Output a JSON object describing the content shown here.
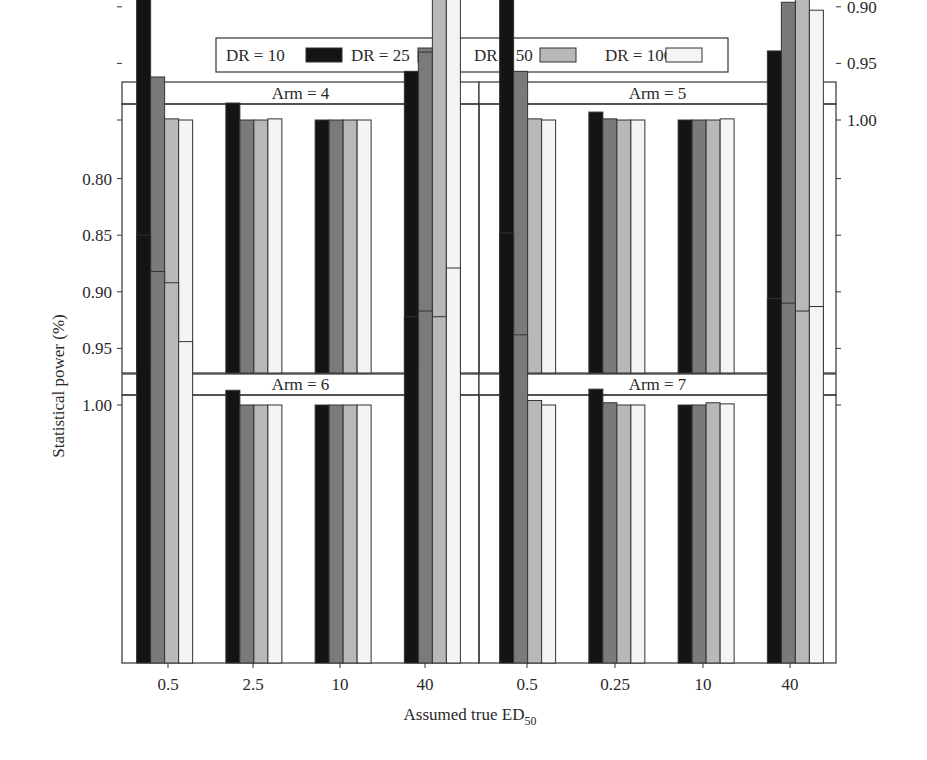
{
  "chart_data": {
    "type": "bar",
    "layout": "2x2 faceted grouped bar chart",
    "title": "",
    "xlabel": "Assumed true ED50",
    "xlabel_main": "Assumed true ED",
    "xlabel_sub": "50",
    "ylabel": "Statistical power (%)",
    "ylim": [
      0.776,
      1.012
    ],
    "yticks": [
      0.8,
      0.85,
      0.9,
      0.95,
      1.0
    ],
    "ytick_labels": [
      "0.80",
      "0.85",
      "0.90",
      "0.95",
      "1.00"
    ],
    "grid": false,
    "legend": {
      "position": "top",
      "entries": [
        {
          "label": "DR = 10",
          "color": "#141414"
        },
        {
          "label": "DR = 25",
          "color": "#7a7a7a"
        },
        {
          "label": "DR = 50",
          "color": "#b8b8b8"
        },
        {
          "label": "DR = 100",
          "color": "#f4f4f4"
        }
      ]
    },
    "panels": [
      {
        "title": "Arm = 4",
        "categories": [
          "0.5",
          "2.5",
          "10",
          "40"
        ],
        "series": [
          {
            "name": "DR = 10",
            "values": [
              0.864,
              0.985,
              1.0,
              0.957
            ]
          },
          {
            "name": "DR = 25",
            "values": [
              0.962,
              1.0,
              1.0,
              0.94
            ]
          },
          {
            "name": "DR = 50",
            "values": [
              0.999,
              1.0,
              1.0,
              0.871
            ]
          },
          {
            "name": "DR = 100",
            "values": [
              1.0,
              0.999,
              1.0,
              0.79
            ]
          }
        ]
      },
      {
        "title": "Arm = 5",
        "categories": [
          "0.5",
          "0.25",
          "10",
          "40"
        ],
        "series": [
          {
            "name": "DR = 10",
            "values": [
              0.843,
              0.993,
              1.0,
              0.939
            ]
          },
          {
            "name": "DR = 25",
            "values": [
              0.957,
              0.999,
              1.0,
              0.896
            ]
          },
          {
            "name": "DR = 50",
            "values": [
              0.999,
              1.0,
              1.0,
              0.874
            ]
          },
          {
            "name": "DR = 100",
            "values": [
              1.0,
              1.0,
              0.999,
              0.903
            ]
          }
        ]
      },
      {
        "title": "Arm = 6",
        "categories": [
          "0.5",
          "2.5",
          "10",
          "40"
        ],
        "series": [
          {
            "name": "DR = 10",
            "values": [
              0.85,
              0.987,
              1.0,
              0.922
            ]
          },
          {
            "name": "DR = 25",
            "values": [
              0.882,
              1.0,
              1.0,
              0.917
            ]
          },
          {
            "name": "DR = 50",
            "values": [
              0.892,
              1.0,
              1.0,
              0.922
            ]
          },
          {
            "name": "DR = 100",
            "values": [
              0.944,
              1.0,
              1.0,
              0.879
            ]
          }
        ]
      },
      {
        "title": "Arm = 7",
        "categories": [
          "0.5",
          "0.25",
          "10",
          "40"
        ],
        "series": [
          {
            "name": "DR = 10",
            "values": [
              0.848,
              0.986,
              1.0,
              0.906
            ]
          },
          {
            "name": "DR = 25",
            "values": [
              0.938,
              0.998,
              1.0,
              0.91
            ]
          },
          {
            "name": "DR = 50",
            "values": [
              0.996,
              1.0,
              0.998,
              0.917
            ]
          },
          {
            "name": "DR = 100",
            "values": [
              1.0,
              1.0,
              0.999,
              0.913
            ]
          }
        ]
      }
    ],
    "bottom_tick_labels": [
      "0.5",
      "2.5",
      "10",
      "40",
      "0.5",
      "0.25",
      "10",
      "40"
    ]
  }
}
